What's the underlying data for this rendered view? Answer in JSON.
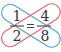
{
  "left_fraction": {
    "numerator": "1",
    "denominator": "2"
  },
  "right_fraction": {
    "numerator": "4",
    "denominator": "8"
  },
  "operator": "=",
  "colors": {
    "loop_1_8": "#5aa3c8",
    "loop_4_2": "#d9687a",
    "text": "#333333",
    "bar": "#444444"
  }
}
